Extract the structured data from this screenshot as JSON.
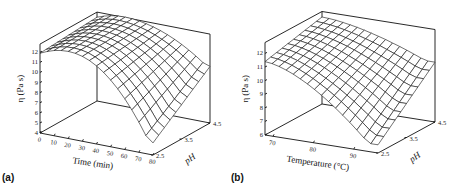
{
  "chart_data": [
    {
      "panel": "(a)",
      "type": "surface3d",
      "title": "",
      "xlabel": "Time (min)",
      "ylabel": "pH",
      "zlabel": "η (Pa s)",
      "x_ticks": [
        0,
        10,
        20,
        30,
        40,
        50,
        60,
        70,
        80
      ],
      "y_ticks": [
        2.5,
        3.5,
        4.5
      ],
      "z_ticks": [
        4,
        5,
        6,
        7,
        8,
        9,
        10,
        11,
        12
      ],
      "xlim": [
        0,
        80
      ],
      "ylim": [
        2.5,
        4.5
      ],
      "zlim": [
        4,
        12.8
      ],
      "grid": {
        "x_steps": 16,
        "y_steps": 10
      },
      "corner_values": {
        "x_min_y_min": 11.9,
        "x_min_y_max": 12.3,
        "x_max_y_min": 5.2,
        "x_max_y_max": 9.6
      },
      "peak_x": 22,
      "screen": {
        "origin": [
          40,
          133
        ],
        "x_end": [
          153,
          155
        ],
        "y_end": [
          97,
          101
        ],
        "z_unit": 10.1
      }
    },
    {
      "panel": "(b)",
      "type": "surface3d",
      "title": "",
      "xlabel": "Temperature (°C)",
      "ylabel": "pH",
      "zlabel": "η (Pa s)",
      "x_ticks": [
        70,
        80,
        90
      ],
      "y_ticks": [
        2.5,
        3.5,
        4.5
      ],
      "z_ticks": [
        6,
        7,
        8,
        9,
        10,
        11,
        12
      ],
      "xlim": [
        68,
        96
      ],
      "ylim": [
        2.5,
        4.5
      ],
      "zlim": [
        6,
        12.8
      ],
      "grid": {
        "x_steps": 16,
        "y_steps": 10
      },
      "corner_values": {
        "x_min_y_min": 11.4,
        "x_min_y_max": 12.4,
        "x_max_y_min": 6.6,
        "x_max_y_max": 10.4
      },
      "peak_x": 68,
      "screen": {
        "origin": [
          265,
          135
        ],
        "x_end": [
          378,
          153
        ],
        "y_end": [
          322,
          104
        ],
        "z_unit": 13.6
      }
    }
  ],
  "labels": {
    "a": "(a)",
    "b": "(b)",
    "a_xlabel": "Time (min)",
    "b_xlabel": "Temperature (°C)",
    "ph_label": "pH",
    "z_label": "η (Pa s)"
  }
}
